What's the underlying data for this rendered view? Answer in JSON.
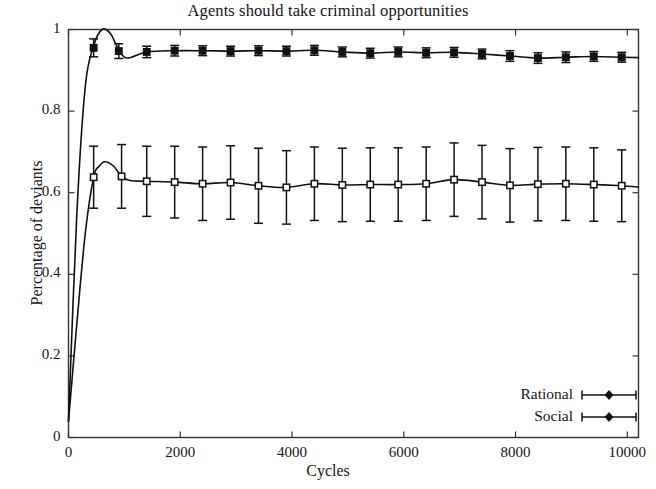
{
  "chart_data": {
    "type": "line",
    "title": "Agents should take criminal opportunities",
    "xlabel": "Cycles",
    "ylabel": "Percentage of deviants",
    "xlim": [
      0,
      10200
    ],
    "ylim": [
      0,
      1
    ],
    "xticks": [
      0,
      2000,
      4000,
      6000,
      8000,
      10000
    ],
    "xtick_labels": [
      "0",
      "2000",
      "4000",
      "6000",
      "8000",
      "10000"
    ],
    "yticks": [
      0,
      0.2,
      0.4,
      0.6,
      0.8,
      1
    ],
    "ytick_labels": [
      "0",
      "0.2",
      "0.4",
      "0.6",
      "0.8",
      "1"
    ],
    "grid": false,
    "legend_position": "lower right",
    "errorbars": true,
    "series": [
      {
        "name": "Rational",
        "marker": "filled-square",
        "x": [
          0,
          150,
          300,
          450,
          600,
          750,
          900,
          1050,
          1400,
          1900,
          2400,
          2900,
          3400,
          3900,
          4400,
          4900,
          5400,
          5900,
          6400,
          6900,
          7400,
          7900,
          8400,
          8900,
          9400,
          9900,
          10200
        ],
        "y": [
          0.04,
          0.55,
          0.86,
          0.96,
          1.0,
          0.99,
          0.95,
          0.93,
          0.945,
          0.948,
          0.948,
          0.947,
          0.948,
          0.947,
          0.949,
          0.945,
          0.942,
          0.945,
          0.943,
          0.944,
          0.94,
          0.935,
          0.93,
          0.932,
          0.934,
          0.932,
          0.931
        ],
        "marker_x": [
          450,
          900,
          1400,
          1900,
          2400,
          2900,
          3400,
          3900,
          4400,
          4900,
          5400,
          5900,
          6400,
          6900,
          7400,
          7900,
          8400,
          8900,
          9400,
          9900
        ],
        "marker_y": [
          0.955,
          0.947,
          0.945,
          0.948,
          0.948,
          0.947,
          0.948,
          0.947,
          0.949,
          0.945,
          0.942,
          0.945,
          0.943,
          0.944,
          0.94,
          0.935,
          0.93,
          0.932,
          0.934,
          0.932
        ],
        "marker_err": [
          0.022,
          0.018,
          0.014,
          0.013,
          0.012,
          0.012,
          0.012,
          0.012,
          0.012,
          0.012,
          0.012,
          0.012,
          0.012,
          0.012,
          0.012,
          0.013,
          0.013,
          0.013,
          0.012,
          0.012
        ]
      },
      {
        "name": "Social",
        "marker": "open-square",
        "x": [
          0,
          150,
          300,
          450,
          550,
          650,
          800,
          950,
          1100,
          1400,
          1900,
          2400,
          2900,
          3400,
          3900,
          4400,
          4900,
          5400,
          5900,
          6400,
          6900,
          7400,
          7900,
          8400,
          8900,
          9400,
          9900,
          10200
        ],
        "y": [
          0.04,
          0.28,
          0.5,
          0.638,
          0.665,
          0.676,
          0.666,
          0.64,
          0.63,
          0.628,
          0.626,
          0.622,
          0.625,
          0.617,
          0.613,
          0.622,
          0.619,
          0.62,
          0.62,
          0.622,
          0.632,
          0.626,
          0.618,
          0.621,
          0.622,
          0.62,
          0.617,
          0.614
        ],
        "marker_x": [
          450,
          950,
          1400,
          1900,
          2400,
          2900,
          3400,
          3900,
          4400,
          4900,
          5400,
          5900,
          6400,
          6900,
          7400,
          7900,
          8400,
          8900,
          9400,
          9900
        ],
        "marker_y": [
          0.638,
          0.64,
          0.628,
          0.626,
          0.622,
          0.625,
          0.617,
          0.613,
          0.622,
          0.619,
          0.62,
          0.62,
          0.622,
          0.632,
          0.626,
          0.618,
          0.621,
          0.622,
          0.62,
          0.617
        ],
        "marker_err": [
          0.076,
          0.078,
          0.086,
          0.088,
          0.09,
          0.09,
          0.092,
          0.09,
          0.09,
          0.09,
          0.09,
          0.09,
          0.09,
          0.09,
          0.09,
          0.09,
          0.09,
          0.09,
          0.09,
          0.088
        ]
      }
    ]
  },
  "legend": {
    "items": [
      {
        "label": "Rational"
      },
      {
        "label": "Social"
      }
    ]
  },
  "colors": {
    "line": "#111111",
    "axis": "#333333",
    "text": "#151515",
    "background": "#ffffff"
  }
}
